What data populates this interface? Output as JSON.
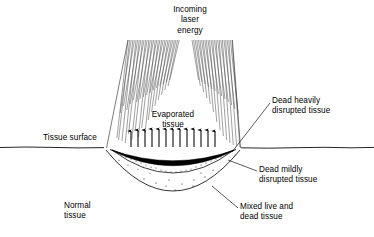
{
  "figure": {
    "width": 374,
    "height": 237,
    "background_color": "#ffffff",
    "line_color": "#000000",
    "type": "cross-section schematic diagram"
  },
  "labels": {
    "title": "Incoming\nlaser\nenergy",
    "evaporated_tissue": "Evaporated\ntissue",
    "tissue_surface": "Tissue surface",
    "normal_tissue": "Normal\ntissue",
    "dead_heavily_disrupted": "Dead heavily\ndisrupted tissue",
    "dead_mildly_disrupted": "Dead mildly\ndisrupted tissue",
    "mixed_live_dead": "Mixed live and\ndead tissue"
  },
  "diagram_elements": {
    "laser_beam": {
      "name": "incoming-laser-beam",
      "style": "dense near-vertical hatch lines, converging cone",
      "hatch_line_count": 96,
      "top_y": 40,
      "bottom_y": 148,
      "top_left_x": 128,
      "top_right_x": 228,
      "bottom_left_x": 106,
      "bottom_right_x": 240
    },
    "vapor_arrows": {
      "name": "evaporated-tissue-arrows",
      "direction": "up",
      "count": 13,
      "base_y": 148,
      "tip_y": 129,
      "left_x": 131,
      "right_x": 215
    },
    "tissue_surface_line": {
      "name": "tissue-surface-line",
      "y": 148,
      "x_start": 0,
      "x_end": 374,
      "style": "slightly wavy horizontal"
    },
    "crater_layers": [
      {
        "name": "dead-heavily-disrupted-layer",
        "fill": "#000000",
        "description": "thin solid black crescent directly lining the crater"
      },
      {
        "name": "dead-mildly-disrupted-layer",
        "fill": "dense stipple",
        "description": "dense stippled band beneath the black char layer"
      },
      {
        "name": "mixed-live-dead-layer",
        "fill": "sparse stipple",
        "description": "large sparse stippled bowl forming outer damage zone"
      }
    ],
    "crater_bounds": {
      "left_x": 105,
      "right_x": 241,
      "top_y": 148,
      "bottom_y": 206
    },
    "leader_lines": [
      {
        "name": "leader-dead-heavily-disrupted",
        "from": [
          270,
          103
        ],
        "to": [
          232,
          152
        ]
      },
      {
        "name": "leader-dead-mildly-disrupted",
        "from": [
          257,
          170
        ],
        "to": [
          228,
          160
        ]
      },
      {
        "name": "leader-mixed-live-dead",
        "from": [
          238,
          207
        ],
        "to": [
          213,
          186
        ]
      }
    ]
  }
}
